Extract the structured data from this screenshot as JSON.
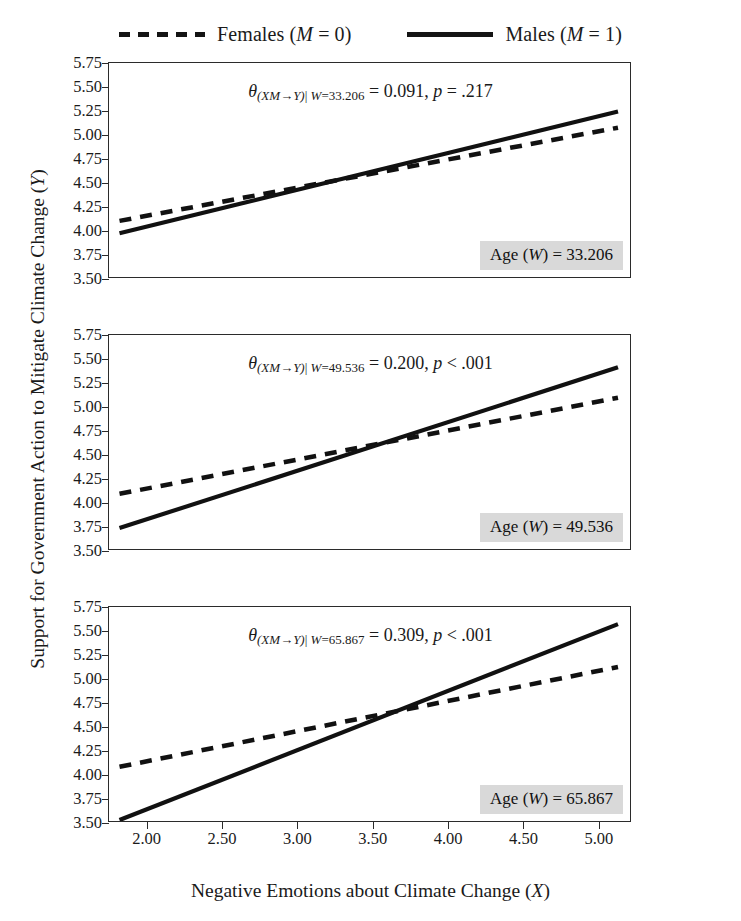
{
  "legend": {
    "items": [
      {
        "key": "dashed",
        "name": "Females",
        "code": "(M = 0)",
        "label": "Females (M = 0)"
      },
      {
        "key": "solid",
        "name": "Males",
        "code": "(M = 1)",
        "label": "Males (M = 1)"
      }
    ]
  },
  "axes": {
    "xlabel": "Negative Emotions about Climate Change (X)",
    "ylabel": "Support for Government Action to Mitigate Climate Change (Y)",
    "yticks": [
      "5.75",
      "5.50",
      "5.25",
      "5.00",
      "4.75",
      "4.50",
      "4.25",
      "4.00",
      "3.75",
      "3.50"
    ],
    "xticks": [
      "2.00",
      "2.50",
      "3.00",
      "3.50",
      "4.00",
      "4.50",
      "5.00"
    ],
    "ylim": [
      3.5,
      5.75
    ],
    "xlim": [
      1.75,
      5.22
    ]
  },
  "panels": [
    {
      "theta_prefix": "θ",
      "theta_sub": "(XM→Y)| W=33.206",
      "theta_value": "= 0.091,",
      "p_label": "p",
      "p_value": "= .217",
      "theta_full": "θ(XM→Y)| W=33.206 = 0.091, p = .217",
      "age_label": "Age (W) = 33.206",
      "age_value": "33.206",
      "effect": 0.091
    },
    {
      "theta_prefix": "θ",
      "theta_sub": "(XM→Y)| W=49.536",
      "theta_value": "= 0.200,",
      "p_label": "p",
      "p_value": "< .001",
      "theta_full": "θ(XM→Y)| W=49.536 = 0.200, p < .001",
      "age_label": "Age (W) = 49.536",
      "age_value": "49.536",
      "effect": 0.2
    },
    {
      "theta_prefix": "θ",
      "theta_sub": "(XM→Y)| W=65.867",
      "theta_value": "= 0.309,",
      "p_label": "p",
      "p_value": "< .001",
      "theta_full": "θ(XM→Y)| W=65.867 = 0.309, p < .001",
      "age_label": "Age (W) = 65.867",
      "age_value": "65.867",
      "effect": 0.309
    }
  ],
  "chart_data": {
    "type": "line",
    "title": "",
    "xlabel": "Negative Emotions about Climate Change (X)",
    "ylabel": "Support for Government Action to Mitigate Climate Change (Y)",
    "xlim": [
      1.75,
      5.22
    ],
    "ylim": [
      3.5,
      5.75
    ],
    "xticks": [
      2.0,
      2.5,
      3.0,
      3.5,
      4.0,
      4.5,
      5.0
    ],
    "yticks": [
      3.5,
      3.75,
      4.0,
      4.25,
      4.5,
      4.75,
      5.0,
      5.25,
      5.5,
      5.75
    ],
    "grid": false,
    "legend_position": "top-center",
    "facets": [
      {
        "name": "Age (W) = 33.206",
        "moderator_value": 33.206,
        "annotation": "θ(XM→Y)| W=33.206 = 0.091, p = .217",
        "series": [
          {
            "name": "Females (M = 0)",
            "style": "dashed",
            "x": [
              1.82,
              5.14
            ],
            "y": [
              4.09,
              5.07
            ]
          },
          {
            "name": "Males (M = 1)",
            "style": "solid",
            "x": [
              1.82,
              5.14
            ],
            "y": [
              3.96,
              5.24
            ]
          }
        ]
      },
      {
        "name": "Age (W) = 49.536",
        "moderator_value": 49.536,
        "annotation": "θ(XM→Y)| W=49.536 = 0.200, p < .001",
        "series": [
          {
            "name": "Females (M = 0)",
            "style": "dashed",
            "x": [
              1.82,
              5.14
            ],
            "y": [
              4.08,
              5.09
            ]
          },
          {
            "name": "Males (M = 1)",
            "style": "solid",
            "x": [
              1.82,
              5.14
            ],
            "y": [
              3.72,
              5.41
            ]
          }
        ]
      },
      {
        "name": "Age (W) = 65.867",
        "moderator_value": 65.867,
        "annotation": "θ(XM→Y)| W=65.867 = 0.309, p < .001",
        "series": [
          {
            "name": "Females (M = 0)",
            "style": "dashed",
            "x": [
              1.82,
              5.14
            ],
            "y": [
              4.07,
              5.12
            ]
          },
          {
            "name": "Males (M = 1)",
            "style": "solid",
            "x": [
              1.82,
              5.14
            ],
            "y": [
              3.51,
              5.57
            ]
          }
        ]
      }
    ]
  }
}
